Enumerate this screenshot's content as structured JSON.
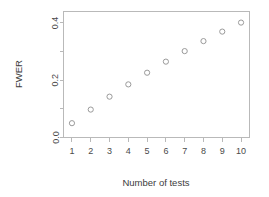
{
  "chart_data": {
    "type": "scatter",
    "title": "",
    "xlabel": "Number of tests",
    "ylabel": "FWER",
    "x": [
      1,
      2,
      3,
      4,
      5,
      6,
      7,
      8,
      9,
      10
    ],
    "values": [
      0.05,
      0.0975,
      0.1426,
      0.1855,
      0.2262,
      0.2649,
      0.3017,
      0.3366,
      0.3698,
      0.4013
    ],
    "series": [
      {
        "name": "FWER",
        "values": [
          0.05,
          0.0975,
          0.1426,
          0.1855,
          0.2262,
          0.2649,
          0.3017,
          0.3366,
          0.3698,
          0.4013
        ]
      }
    ],
    "xlim": [
      0.55,
      10.45
    ],
    "ylim": [
      0.0,
      0.44
    ],
    "xticks": [
      1,
      2,
      3,
      4,
      5,
      6,
      7,
      8,
      9,
      10
    ],
    "xticklabels": [
      "1",
      "2",
      "3",
      "4",
      "5",
      "6",
      "7",
      "8",
      "9",
      "10"
    ],
    "yticks": [
      0.0,
      0.1,
      0.2,
      0.3,
      0.4
    ],
    "yticklabels": [
      "0.0",
      "",
      "0.2",
      "",
      "0.4"
    ],
    "ylabels_shown": [
      "0.0",
      "0.2",
      "0.4"
    ],
    "grid": false,
    "legend": false,
    "marker": "open-circle",
    "marker_color": "#9a9a9a",
    "axis_color": "#b9b9b9",
    "background": "#ffffff"
  },
  "axes": {
    "x_title": "Number of tests",
    "y_title": "FWER"
  }
}
